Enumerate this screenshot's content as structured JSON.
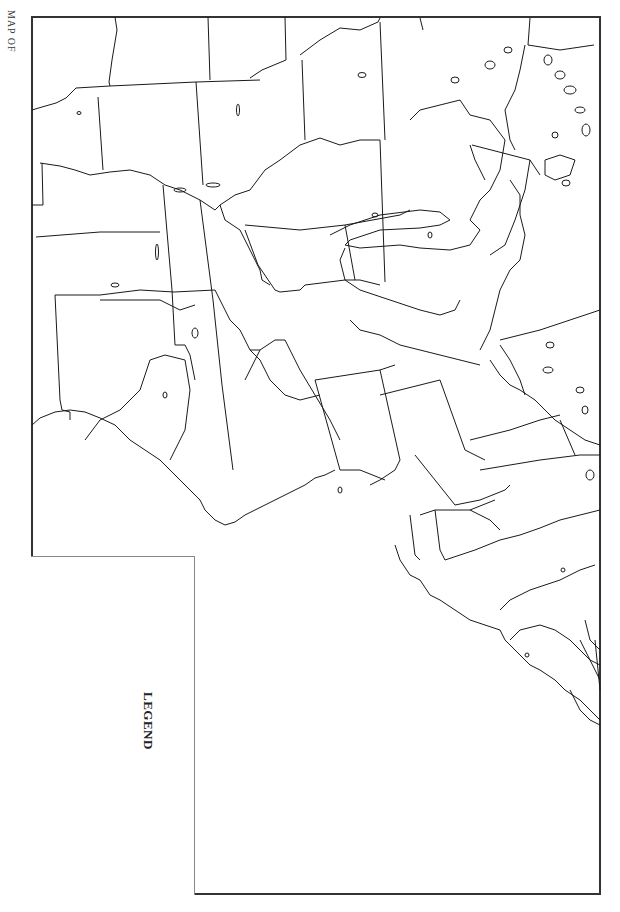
{
  "map": {
    "title": "MAP OF",
    "legend_title": "LEGEND",
    "orientation": "rotated 90 degrees clockwise (north points right)",
    "region": "Eastern United States outline",
    "colors": {
      "background": "#ffffff",
      "frame": "#333333",
      "boundaries": "#1a1a1a",
      "legend_border": "#888888"
    },
    "features": [
      "state boundaries",
      "great lakes outlines",
      "gulf coast",
      "atlantic coast",
      "lake islands"
    ]
  }
}
